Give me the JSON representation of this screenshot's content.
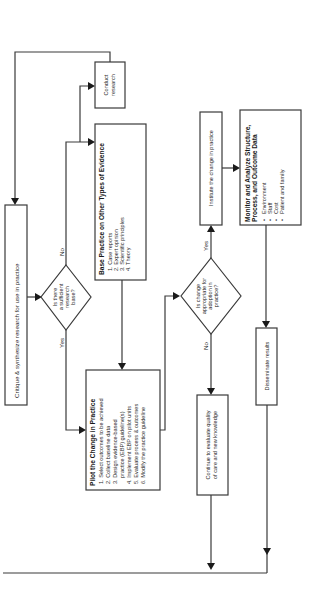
{
  "diagram": {
    "orientation": "rotated 90 degrees counter-clockwise",
    "nodes": {
      "critique": {
        "label": "Critique & synthesize research for use in practice"
      },
      "decision_research": {
        "lines": [
          "Is there",
          "a sufficient",
          "research",
          "base?"
        ],
        "yes_label": "Yes",
        "no_label": "No"
      },
      "conduct_research": {
        "lines": [
          "Conduct",
          "research"
        ]
      },
      "base_practice": {
        "title": "Base Practice on Other Types of Evidence",
        "items": [
          "1. Case reports",
          "2. Expert opinion",
          "3. Scientific principles",
          "4. Theory"
        ]
      },
      "pilot": {
        "title": "Pilot the Change in Practice",
        "items": [
          "1. Select outcomes to be achieved",
          "2. Collect baseline data",
          "3. Design evidence-based",
          "    practice (EBP) guideline(s)",
          "4. Implement EBP on pilot units",
          "5. Evaluate process & outcomes",
          "6. Modify the practice guideline"
        ]
      },
      "decision_adoption": {
        "lines": [
          "Is change",
          "appropriate for",
          "adoption in",
          "practice?"
        ],
        "yes_label": "Yes",
        "no_label": "No"
      },
      "institute": {
        "label": "Institute the change in practice"
      },
      "continue_eval": {
        "lines": [
          "Continue to evaluate quality",
          "of care and new knowledge"
        ]
      },
      "monitor": {
        "title_lines": [
          "Monitor and Analyze Structure,",
          "Process, and Outcome Data"
        ],
        "items": [
          "Environment",
          "Staff",
          "Cost",
          "Patient and family"
        ],
        "bullet": "•"
      },
      "disseminate": {
        "label": "Disseminate results"
      }
    },
    "colors": {
      "line": "#3a3a3a",
      "arrow": "#1a1a1a",
      "background": "#ffffff"
    }
  }
}
